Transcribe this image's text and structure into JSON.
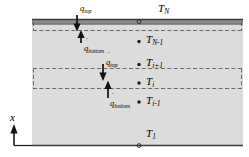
{
  "figure": {
    "axis": {
      "label": "x",
      "direction": "up"
    },
    "slab": {
      "fill_color": "#dcdcdc",
      "surface_band_color": "#8c8c8c",
      "outline_color": "#4d4d4d",
      "control_volume_line_color": "#555555"
    },
    "node_labels": [
      {
        "name": "T_N",
        "base": "T",
        "sub": "N",
        "x": 158,
        "y": 4
      },
      {
        "name": "T_N-1",
        "base": "T",
        "sub": "N-1",
        "x": 143,
        "y": 36
      },
      {
        "name": "T_i+1",
        "base": "T",
        "sub": "i+1",
        "x": 143,
        "y": 59
      },
      {
        "name": "T_i",
        "base": "T",
        "sub": "i",
        "x": 143,
        "y": 78
      },
      {
        "name": "T_i-1",
        "base": "T",
        "sub": "i-1",
        "x": 143,
        "y": 97
      },
      {
        "name": "T_1",
        "base": "T",
        "sub": "1",
        "x": 143,
        "y": 130
      }
    ],
    "flux_labels": [
      {
        "name": "q-top-upper",
        "base": "q",
        "sub": "top",
        "x": 78,
        "y": 3,
        "arrow": "down"
      },
      {
        "name": "q-bottom-upper",
        "base": "q",
        "sub": "bottom",
        "x": 81,
        "y": 43,
        "arrow": "up"
      },
      {
        "name": "q-top-lower",
        "base": "q",
        "sub": "top",
        "x": 104,
        "y": 58,
        "arrow": "down"
      },
      {
        "name": "q-bottom-lower",
        "base": "q",
        "sub": "bottom",
        "x": 107,
        "y": 97,
        "arrow": "up"
      }
    ],
    "dot_accent": "˙",
    "minus": "-",
    "plus": "+"
  }
}
